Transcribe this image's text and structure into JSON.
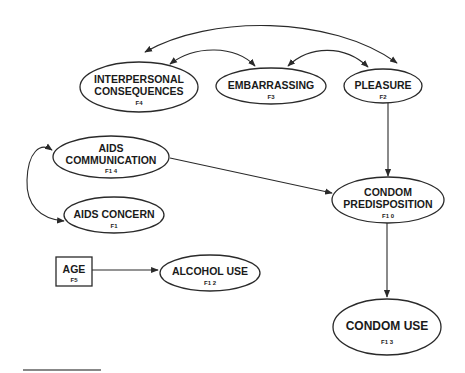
{
  "diagram": {
    "colors": {
      "stroke": "#2a2a2a",
      "text": "#1a1a1a",
      "background": "#ffffff",
      "footer_rule": "#888888"
    },
    "nodes": {
      "interpersonal": {
        "line1": "INTERPERSONAL",
        "line2": "CONSEQUENCES",
        "code": "F4",
        "shape": "ellipse"
      },
      "embarrassing": {
        "line1": "EMBARRASSING",
        "code": "F3",
        "shape": "ellipse"
      },
      "pleasure": {
        "line1": "PLEASURE",
        "code": "F2",
        "shape": "ellipse"
      },
      "aids_communication": {
        "line1": "AIDS",
        "line2": "COMMUNICATION",
        "code": "F1 4",
        "shape": "ellipse"
      },
      "aids_concern": {
        "line1": "AIDS CONCERN",
        "code": "F1",
        "shape": "ellipse"
      },
      "condom_predisposition": {
        "line1": "CONDOM",
        "line2": "PREDISPOSITION",
        "code": "F1 0",
        "shape": "ellipse"
      },
      "age": {
        "line1": "AGE",
        "code": "F5",
        "shape": "rectangle"
      },
      "alcohol_use": {
        "line1": "ALCOHOL USE",
        "code": "F1 2",
        "shape": "ellipse"
      },
      "condom_use": {
        "line1": "CONDOM USE",
        "code": "F1 3",
        "shape": "ellipse"
      }
    },
    "edges": [
      {
        "from": "interpersonal",
        "to": "pleasure",
        "type": "bidirectional-curve"
      },
      {
        "from": "interpersonal",
        "to": "embarrassing",
        "type": "bidirectional-curve"
      },
      {
        "from": "embarrassing",
        "to": "pleasure",
        "type": "bidirectional-curve"
      },
      {
        "from": "pleasure",
        "to": "condom_predisposition",
        "type": "directed"
      },
      {
        "from": "aids_communication",
        "to": "condom_predisposition",
        "type": "directed"
      },
      {
        "from": "aids_communication",
        "to": "aids_concern",
        "type": "bidirectional-curve"
      },
      {
        "from": "age",
        "to": "alcohol_use",
        "type": "directed"
      },
      {
        "from": "condom_predisposition",
        "to": "condom_use",
        "type": "directed"
      }
    ]
  }
}
